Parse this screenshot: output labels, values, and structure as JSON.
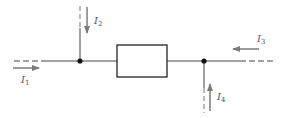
{
  "diagram": {
    "type": "circuit-node-currents",
    "colors": {
      "wire": "#444444",
      "arrow": "#7a7a7a",
      "node": "#111111",
      "label": "#555555"
    },
    "currents": [
      {
        "id": "I1",
        "symbol": "I",
        "sub": "1",
        "direction": "right",
        "position": "left-incoming"
      },
      {
        "id": "I2",
        "symbol": "I",
        "sub": "2",
        "direction": "down",
        "position": "top-incoming-left-node"
      },
      {
        "id": "I3",
        "symbol": "I",
        "sub": "3",
        "direction": "left",
        "position": "right-incoming"
      },
      {
        "id": "I4",
        "symbol": "I",
        "sub": "4",
        "direction": "up",
        "position": "bottom-incoming-right-node"
      }
    ],
    "components": [
      {
        "type": "resistor-box"
      }
    ],
    "nodes": 2
  }
}
